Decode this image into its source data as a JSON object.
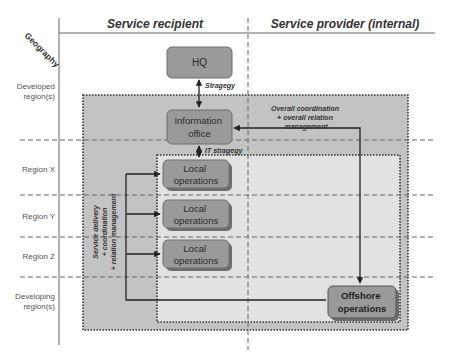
{
  "axis": {
    "geography_label": "Geography"
  },
  "columns": {
    "recipient": "Service recipient",
    "provider": "Service provider (internal)"
  },
  "rows": [
    {
      "label_lines": [
        "Developed",
        "region(s)"
      ]
    },
    {
      "label_lines": [
        "Region X"
      ]
    },
    {
      "label_lines": [
        "Region Y"
      ]
    },
    {
      "label_lines": [
        "Region Z"
      ]
    },
    {
      "label_lines": [
        "Developing",
        "region(s)"
      ]
    }
  ],
  "nodes": {
    "hq": {
      "lines": [
        "HQ"
      ]
    },
    "info_office": {
      "lines": [
        "Information",
        "office"
      ]
    },
    "local_ops": [
      {
        "lines": [
          "Local",
          "operations"
        ]
      },
      {
        "lines": [
          "Local",
          "operations"
        ]
      },
      {
        "lines": [
          "Local",
          "operations"
        ]
      }
    ],
    "offshore": {
      "lines": [
        "Offshore",
        "operations"
      ]
    }
  },
  "edges": {
    "strategy": "Stragegy",
    "it_strategy": "IT stragegy",
    "overall": [
      "Overall coordination",
      "+ overall relation",
      "management"
    ],
    "service_delivery": [
      "Service delivery",
      "+ coordination",
      "+ relation management"
    ]
  },
  "colors": {
    "outer_zone": "#c3c3c3",
    "inner_zone": "#e2e2e2",
    "node_fill": "#9a9a9a",
    "node_stroke": "#6e6e6e",
    "line": "#222222",
    "text": "#333333",
    "label_text": "#555555"
  }
}
